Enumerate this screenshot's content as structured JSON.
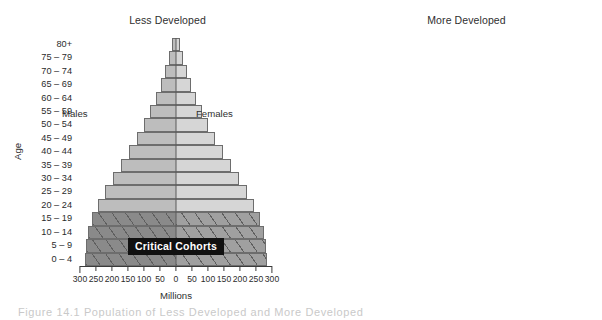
{
  "figure": {
    "caption": "Figure 14.1   Population of Less Developed and More Developed"
  },
  "axes_common": {
    "x_title": "Millions",
    "y_title": "Age",
    "x_ticklabels": [
      "300",
      "250",
      "200",
      "150",
      "100",
      "50",
      "0",
      "50",
      "100",
      "150",
      "200",
      "250",
      "300"
    ],
    "x_tickvalues": [
      -300,
      -250,
      -200,
      -150,
      -100,
      -50,
      0,
      50,
      100,
      150,
      200,
      250,
      300
    ],
    "male_label": "Males",
    "female_label": "Females",
    "age_groups": [
      "80+",
      "75 – 79",
      "70 – 74",
      "65 – 69",
      "60 – 64",
      "55 – 59",
      "50 – 54",
      "45 – 49",
      "40 – 44",
      "35 – 39",
      "30 – 34",
      "25 – 29",
      "20 – 24",
      "15 – 19",
      "10 – 14",
      "5 – 9",
      "0 – 4"
    ],
    "critical_badge": "Critical Cohorts"
  },
  "colors": {
    "bar_male": "#bdbdbd",
    "bar_female": "#d6d6d6",
    "bar_male_critical": "#8a8a8a",
    "bar_female_critical": "#a0a0a0",
    "bar_outline": "#6d6d6d",
    "axis": "#3a3a3a",
    "badge_bg": "#111111",
    "badge_text": "#ffffff"
  },
  "chart_data": [
    {
      "type": "bar",
      "title": "Less Developed",
      "xlabel": "Millions",
      "ylabel": "Age",
      "xlim": [
        -300,
        300
      ],
      "grid": false,
      "orientation": "population-pyramid",
      "categories": [
        "80+",
        "75 – 79",
        "70 – 74",
        "65 – 69",
        "60 – 64",
        "55 – 59",
        "50 – 54",
        "45 – 49",
        "40 – 44",
        "35 – 39",
        "30 – 34",
        "25 – 29",
        "20 – 24",
        "15 – 19",
        "10 – 14",
        "5 – 9",
        "0 – 4"
      ],
      "series": [
        {
          "name": "Males",
          "values": [
            12,
            22,
            33,
            47,
            62,
            80,
            100,
            122,
            147,
            172,
            196,
            220,
            242,
            262,
            275,
            282,
            285
          ]
        },
        {
          "name": "Females",
          "values": [
            14,
            24,
            35,
            49,
            64,
            82,
            102,
            124,
            148,
            173,
            197,
            221,
            243,
            263,
            276,
            283,
            286
          ]
        }
      ],
      "highlight": {
        "label": "Critical Cohorts",
        "categories": [
          "15 – 19",
          "10 – 14",
          "5 – 9",
          "0 – 4"
        ],
        "style": "dark-hatched"
      }
    },
    {
      "type": "bar",
      "title": "More Developed",
      "xlabel": "Millions",
      "ylabel": "Age",
      "xlim": [
        -300,
        300
      ],
      "grid": false,
      "orientation": "population-pyramid",
      "categories": [
        "80+",
        "75 – 79",
        "70 – 74",
        "65 – 69",
        "60 – 64",
        "55 – 59",
        "50 – 54",
        "45 – 49",
        "40 – 44",
        "35 – 39",
        "30 – 34",
        "25 – 29",
        "20 – 24",
        "15 – 19",
        "10 – 14",
        "5 – 9",
        "0 – 4"
      ],
      "series": [
        {
          "name": "Males",
          "values": [
            14,
            18,
            24,
            28,
            32,
            36,
            38,
            42,
            48,
            50,
            50,
            46,
            40,
            38,
            36,
            33,
            31
          ]
        },
        {
          "name": "Females",
          "values": [
            22,
            24,
            28,
            31,
            34,
            37,
            39,
            43,
            48,
            50,
            50,
            46,
            40,
            37,
            35,
            32,
            30
          ]
        }
      ],
      "highlight": null
    }
  ],
  "panels": [
    {
      "title": "Less Developed"
    },
    {
      "title": "More Developed"
    }
  ]
}
